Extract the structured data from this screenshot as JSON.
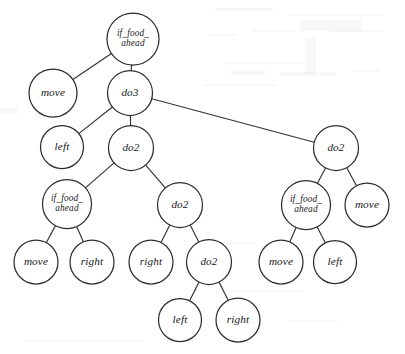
{
  "figure": {
    "kind": "tree-diagram",
    "title": "",
    "background_color": "#ffffff",
    "node_fill_color": "#ffffff",
    "node_stroke_color": "#2e2e2b",
    "edge_color": "#33332f",
    "label_color": "#17171a",
    "width": 405,
    "height": 354
  },
  "nodes": [
    {
      "id": "n0",
      "label": "if_food_ahead",
      "lines": [
        "if_food_",
        "ahead"
      ],
      "cx": 133,
      "cy": 39,
      "r": 26,
      "depth": 0
    },
    {
      "id": "n1",
      "label": "move",
      "lines": [
        "move"
      ],
      "cx": 53,
      "cy": 93,
      "r": 24,
      "depth": 1
    },
    {
      "id": "n2",
      "label": "do3",
      "lines": [
        "do3"
      ],
      "cx": 130,
      "cy": 93,
      "r": 22.5,
      "depth": 1
    },
    {
      "id": "n3",
      "label": "left",
      "lines": [
        "left"
      ],
      "cx": 62,
      "cy": 147,
      "r": 21.5,
      "depth": 2
    },
    {
      "id": "n4",
      "label": "do2",
      "lines": [
        "do2"
      ],
      "cx": 131,
      "cy": 148,
      "r": 22.5,
      "depth": 2
    },
    {
      "id": "n5",
      "label": "do2",
      "lines": [
        "do2"
      ],
      "cx": 336,
      "cy": 148,
      "r": 22.5,
      "depth": 2
    },
    {
      "id": "n6",
      "label": "if_food_ahead",
      "lines": [
        "if_food_",
        "ahead"
      ],
      "cx": 67,
      "cy": 204,
      "r": 24.5,
      "depth": 3
    },
    {
      "id": "n7",
      "label": "do2",
      "lines": [
        "do2"
      ],
      "cx": 180,
      "cy": 205,
      "r": 22.5,
      "depth": 3
    },
    {
      "id": "n8",
      "label": "if_food_ahead",
      "lines": [
        "if_food_",
        "ahead"
      ],
      "cx": 306,
      "cy": 205,
      "r": 24.5,
      "depth": 3
    },
    {
      "id": "n9",
      "label": "move",
      "lines": [
        "move"
      ],
      "cx": 367,
      "cy": 205,
      "r": 22,
      "depth": 3
    },
    {
      "id": "n10",
      "label": "move",
      "lines": [
        "move"
      ],
      "cx": 36,
      "cy": 262,
      "r": 22,
      "depth": 4
    },
    {
      "id": "n11",
      "label": "right",
      "lines": [
        "right"
      ],
      "cx": 92,
      "cy": 262,
      "r": 22,
      "depth": 4
    },
    {
      "id": "n12",
      "label": "right",
      "lines": [
        "right"
      ],
      "cx": 151,
      "cy": 262,
      "r": 22,
      "depth": 4
    },
    {
      "id": "n13",
      "label": "do2",
      "lines": [
        "do2"
      ],
      "cx": 209,
      "cy": 262,
      "r": 22.5,
      "depth": 4
    },
    {
      "id": "n14",
      "label": "move",
      "lines": [
        "move"
      ],
      "cx": 281,
      "cy": 262,
      "r": 22,
      "depth": 4
    },
    {
      "id": "n15",
      "label": "left",
      "lines": [
        "left"
      ],
      "cx": 335,
      "cy": 262,
      "r": 21.5,
      "depth": 4
    },
    {
      "id": "n16",
      "label": "left",
      "lines": [
        "left"
      ],
      "cx": 180,
      "cy": 320,
      "r": 21.5,
      "depth": 5
    },
    {
      "id": "n17",
      "label": "right",
      "lines": [
        "right"
      ],
      "cx": 238,
      "cy": 320,
      "r": 22,
      "depth": 5
    }
  ],
  "edges": [
    {
      "from": "n0",
      "to": "n1"
    },
    {
      "from": "n0",
      "to": "n2"
    },
    {
      "from": "n2",
      "to": "n3"
    },
    {
      "from": "n2",
      "to": "n4"
    },
    {
      "from": "n2",
      "to": "n5"
    },
    {
      "from": "n4",
      "to": "n6"
    },
    {
      "from": "n4",
      "to": "n7"
    },
    {
      "from": "n5",
      "to": "n8"
    },
    {
      "from": "n5",
      "to": "n9"
    },
    {
      "from": "n6",
      "to": "n10"
    },
    {
      "from": "n6",
      "to": "n11"
    },
    {
      "from": "n7",
      "to": "n12"
    },
    {
      "from": "n7",
      "to": "n13"
    },
    {
      "from": "n8",
      "to": "n14"
    },
    {
      "from": "n8",
      "to": "n15"
    },
    {
      "from": "n13",
      "to": "n16"
    },
    {
      "from": "n13",
      "to": "n17"
    }
  ],
  "artifacts": [
    {
      "x": 214,
      "y": 8,
      "w": 60,
      "h": 3
    },
    {
      "x": 288,
      "y": 14,
      "w": 96,
      "h": 2
    },
    {
      "x": 300,
      "y": 20,
      "w": 62,
      "h": 11
    },
    {
      "x": 210,
      "y": 34,
      "w": 26,
      "h": 2
    },
    {
      "x": 252,
      "y": 30,
      "w": 44,
      "h": 2
    },
    {
      "x": 330,
      "y": 30,
      "w": 54,
      "h": 2
    },
    {
      "x": 306,
      "y": 38,
      "w": 10,
      "h": 36
    },
    {
      "x": 226,
      "y": 62,
      "w": 78,
      "h": 2
    },
    {
      "x": 230,
      "y": 70,
      "w": 36,
      "h": 5
    },
    {
      "x": 280,
      "y": 72,
      "w": 56,
      "h": 4
    },
    {
      "x": 352,
      "y": 70,
      "w": 28,
      "h": 2
    },
    {
      "x": 204,
      "y": 84,
      "w": 72,
      "h": 2
    },
    {
      "x": 0,
      "y": 108,
      "w": 18,
      "h": 6
    },
    {
      "x": 196,
      "y": 242,
      "w": 60,
      "h": 2
    },
    {
      "x": 300,
      "y": 254,
      "w": 52,
      "h": 2
    },
    {
      "x": 232,
      "y": 290,
      "w": 70,
      "h": 2
    },
    {
      "x": 290,
      "y": 320,
      "w": 48,
      "h": 2
    },
    {
      "x": 24,
      "y": 340,
      "w": 120,
      "h": 2
    }
  ]
}
